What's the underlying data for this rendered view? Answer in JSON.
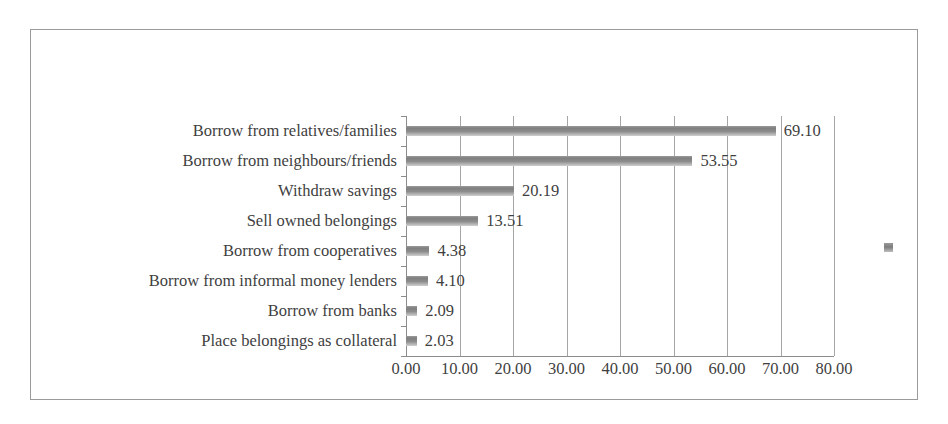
{
  "chart_data": {
    "type": "bar",
    "orientation": "horizontal",
    "title": "",
    "subtitle": "",
    "xlabel": "",
    "ylabel": "",
    "categories": [
      "Borrow from relatives/families",
      "Borrow from neighbours/friends",
      "Withdraw savings",
      "Sell owned belongings",
      "Borrow from cooperatives",
      "Borrow from informal money lenders",
      "Borrow from banks",
      "Place belongings as collateral"
    ],
    "values": [
      69.1,
      53.55,
      20.19,
      13.51,
      4.38,
      4.1,
      2.09,
      2.03
    ],
    "data_labels": [
      "69.10",
      "53.55",
      "20.19",
      "13.51",
      "4.38",
      "4.10",
      "2.09",
      "2.03"
    ],
    "xlim": [
      0,
      80
    ],
    "xticks": [
      0,
      10,
      20,
      30,
      40,
      50,
      60,
      70,
      80
    ],
    "xtick_labels": [
      "0.00",
      "10.00",
      "20.00",
      "30.00",
      "40.00",
      "50.00",
      "60.00",
      "70.00",
      "80.00"
    ],
    "grid": "vertical",
    "legend": {
      "position": "right",
      "entries": [
        {
          "label": "",
          "color": "#808080",
          "marker": "square"
        }
      ]
    },
    "series": [
      {
        "name": "",
        "color": "#808080",
        "values": [
          69.1,
          53.55,
          20.19,
          13.51,
          4.38,
          4.1,
          2.09,
          2.03
        ]
      }
    ]
  },
  "style": {
    "bar_color": "#808080",
    "frame_border_color": "#9a9a9a",
    "gridline_color": "#a6a6a6",
    "axis_color": "#8c8c8c",
    "text_color": "#3f3f3f",
    "background": "#ffffff"
  }
}
